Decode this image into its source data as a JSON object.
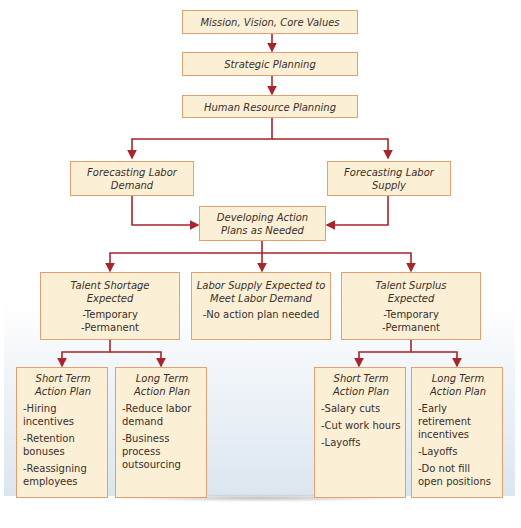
{
  "diagram": {
    "top": {
      "mission": "Mission, Vision, Core Values",
      "strategic": "Strategic Planning",
      "hrp": "Human Resource Planning"
    },
    "forecast": {
      "demand": [
        "Forecasting Labor",
        "Demand"
      ],
      "supply": [
        "Forecasting Labor",
        "Supply"
      ]
    },
    "action": [
      "Developing Action",
      "Plans as Needed"
    ],
    "scenarios": {
      "shortage": {
        "title": [
          "Talent Shortage",
          "Expected"
        ],
        "items": [
          "-Temporary",
          "-Permanent"
        ]
      },
      "balance": {
        "title": [
          "Labor Supply Expected to",
          "Meet Labor Demand"
        ],
        "items": [
          "-No action plan needed"
        ]
      },
      "surplus": {
        "title": [
          "Talent Surplus",
          "Expected"
        ],
        "items": [
          "-Temporary",
          "-Permanent"
        ]
      }
    },
    "plans": {
      "shortage_short": {
        "title": [
          "Short Term",
          "Action Plan"
        ],
        "items": [
          "-Hiring incentives",
          "-Retention bonuses",
          "-Reassigning employees"
        ]
      },
      "shortage_long": {
        "title": [
          "Long Term",
          "Action Plan"
        ],
        "items": [
          "-Reduce labor demand",
          "-Business process outsourcing"
        ]
      },
      "surplus_short": {
        "title": [
          "Short Term",
          "Action Plan"
        ],
        "items": [
          "-Salary cuts",
          "-Cut work hours",
          "-Layoffs"
        ]
      },
      "surplus_long": {
        "title": [
          "Long Term",
          "Action Plan"
        ],
        "items": [
          "-Early retirement incentives",
          "-Layoffs",
          "-Do not fill open positions"
        ]
      }
    },
    "colors": {
      "box_fill": "#fbf0d6",
      "box_border": "#e0a070",
      "arrow": "#a8252c",
      "text": "#3a2e28"
    }
  }
}
